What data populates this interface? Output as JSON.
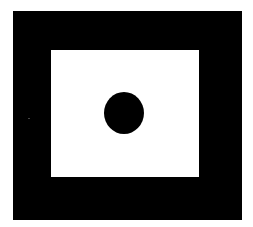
{
  "figure": {
    "colors": {
      "background": "#ffffff",
      "frame": "#000000",
      "inner_panel": "#ffffff",
      "dot": "#000000"
    },
    "shapes": [
      {
        "name": "outer-frame",
        "type": "rectangle",
        "x": 13,
        "y": 11,
        "width": 229,
        "height": 209,
        "fill": "#000000"
      },
      {
        "name": "inner-panel",
        "type": "rectangle",
        "x": 51,
        "y": 50,
        "width": 148,
        "height": 127,
        "fill": "#ffffff"
      },
      {
        "name": "center-dot",
        "type": "ellipse",
        "cx": 124,
        "cy": 113,
        "rx": 20,
        "ry": 21,
        "fill": "#000000"
      }
    ]
  }
}
